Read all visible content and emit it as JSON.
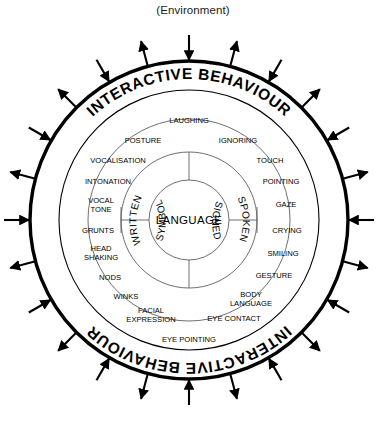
{
  "figure": {
    "environment_label": "(Environment)",
    "band_label_top": "INTERACTIVE BEHAVIOUR",
    "band_label_bottom": "INTERACTIVE BEHAVIOUR",
    "center_label": "LANGUAGE"
  },
  "modes": [
    {
      "id": "written",
      "label": "WRITTEN"
    },
    {
      "id": "spoken",
      "label": "SPOKEN"
    },
    {
      "id": "symbol",
      "label": "SYMBOL"
    },
    {
      "id": "signed",
      "label": "SIGNED"
    }
  ],
  "inner_ring": [
    {
      "label": "VOCALISATION",
      "x": 118,
      "y": 163,
      "anchor": "middle"
    },
    {
      "label": "INTONATION",
      "x": 108,
      "y": 184,
      "anchor": "middle"
    },
    {
      "label": "VOCAL",
      "x": 101,
      "y": 203,
      "anchor": "middle"
    },
    {
      "label": "TONE",
      "x": 101,
      "y": 212,
      "anchor": "middle"
    },
    {
      "label": "GRUNTS",
      "x": 98,
      "y": 233,
      "anchor": "middle"
    },
    {
      "label": "HEAD",
      "x": 101,
      "y": 251,
      "anchor": "middle"
    },
    {
      "label": "SHAKING",
      "x": 101,
      "y": 260,
      "anchor": "middle"
    },
    {
      "label": "NODS",
      "x": 110,
      "y": 280,
      "anchor": "middle"
    },
    {
      "label": "WINKS",
      "x": 126,
      "y": 299,
      "anchor": "middle"
    },
    {
      "label": "FACIAL",
      "x": 151,
      "y": 313,
      "anchor": "middle"
    },
    {
      "label": "EXPRESSION",
      "x": 151,
      "y": 322,
      "anchor": "middle"
    },
    {
      "label": "TOUCH",
      "x": 270,
      "y": 163,
      "anchor": "middle"
    },
    {
      "label": "POINTING",
      "x": 281,
      "y": 184,
      "anchor": "middle"
    },
    {
      "label": "GAZE",
      "x": 286,
      "y": 207,
      "anchor": "middle"
    },
    {
      "label": "CRYING",
      "x": 287,
      "y": 233,
      "anchor": "middle"
    },
    {
      "label": "SMILING",
      "x": 283,
      "y": 256,
      "anchor": "middle"
    },
    {
      "label": "GESTURE",
      "x": 274,
      "y": 278,
      "anchor": "middle"
    },
    {
      "label": "BODY",
      "x": 251,
      "y": 297,
      "anchor": "middle"
    },
    {
      "label": "LANGUAGE",
      "x": 251,
      "y": 306,
      "anchor": "middle"
    },
    {
      "label": "EYE CONTACT",
      "x": 234,
      "y": 321,
      "anchor": "middle"
    }
  ],
  "outer_ring": [
    {
      "label": "LAUGHING",
      "x": 189,
      "y": 123,
      "anchor": "middle"
    },
    {
      "label": "POSTURE",
      "x": 143,
      "y": 143,
      "anchor": "middle"
    },
    {
      "label": "IGNORING",
      "x": 238,
      "y": 143,
      "anchor": "middle"
    },
    {
      "label": "EYE POINTING",
      "x": 189,
      "y": 342,
      "anchor": "middle"
    }
  ],
  "arrows": {
    "inward_symbol": "arrow-inward",
    "outward_symbol": "arrow-outward",
    "count": 24
  },
  "colors": {
    "stroke": "#000000",
    "background": "#ffffff",
    "thin_stroke": "#3a3a3a"
  }
}
